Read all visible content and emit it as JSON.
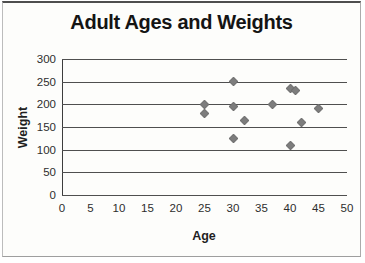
{
  "chart_data": {
    "type": "scatter",
    "title": "Adult Ages and Weights",
    "xlabel": "Age",
    "ylabel": "Weight",
    "xlim": [
      0,
      50
    ],
    "ylim": [
      0,
      300
    ],
    "x_ticks": [
      0,
      5,
      10,
      15,
      20,
      25,
      30,
      35,
      40,
      45,
      50
    ],
    "y_ticks": [
      0,
      50,
      100,
      150,
      200,
      250,
      300
    ],
    "grid": "horizontal-only",
    "legend": "none",
    "marker": "diamond",
    "marker_color": "#7d7d7d",
    "gridline_color": "#4f4f4f",
    "points": [
      {
        "x": 25,
        "y": 200
      },
      {
        "x": 25,
        "y": 180
      },
      {
        "x": 30,
        "y": 250
      },
      {
        "x": 30,
        "y": 195
      },
      {
        "x": 30,
        "y": 125
      },
      {
        "x": 32,
        "y": 165
      },
      {
        "x": 37,
        "y": 200
      },
      {
        "x": 40,
        "y": 235
      },
      {
        "x": 41,
        "y": 230
      },
      {
        "x": 40,
        "y": 110
      },
      {
        "x": 42,
        "y": 160
      },
      {
        "x": 45,
        "y": 190
      }
    ]
  }
}
